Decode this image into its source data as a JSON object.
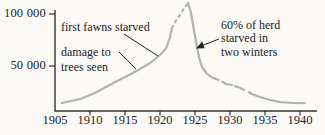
{
  "chart_data": {
    "type": "line",
    "title": "",
    "xlabel": "",
    "ylabel": "",
    "legend": "none",
    "grid": false,
    "x_axis": {
      "min": 1905,
      "max": 1941,
      "tick_labels": [
        "1905",
        "1910",
        "1915",
        "1920",
        "1925",
        "1930",
        "1935",
        "1940"
      ],
      "tick_years": [
        1905,
        1910,
        1915,
        1920,
        1925,
        1930,
        1935,
        1940
      ],
      "tick_mark_years": [
        1910,
        1915,
        1920,
        1925,
        1930,
        1935,
        1940
      ]
    },
    "y_axis": {
      "tick_labels": [
        "50 000",
        "100 000"
      ],
      "tick_values": [
        50000,
        100000
      ],
      "range_shown": [
        7000,
        112000
      ]
    },
    "series": [
      {
        "name": "deer herd population",
        "segments": [
          {
            "style": "solid",
            "points": [
              [
                1906.0,
                14400
              ],
              [
                1908.6,
                18300
              ],
              [
                1910.7,
                24000
              ],
              [
                1913.6,
                34600
              ],
              [
                1916.4,
                44200
              ],
              [
                1918.6,
                52900
              ],
              [
                1920.0,
                60600
              ],
              [
                1920.9,
                67300
              ],
              [
                1921.4,
                76900
              ],
              [
                1921.7,
                86500
              ]
            ]
          },
          {
            "style": "dashed",
            "points": [
              [
                1921.7,
                86500
              ],
              [
                1922.0,
                90400
              ],
              [
                1922.4,
                95000
              ],
              [
                1922.9,
                99500
              ],
              [
                1923.3,
                103800
              ],
              [
                1923.7,
                107700
              ],
              [
                1924.0,
                110600
              ]
            ]
          },
          {
            "style": "solid",
            "points": [
              [
                1924.0,
                110600
              ],
              [
                1924.4,
                101900
              ],
              [
                1924.7,
                90400
              ],
              [
                1925.0,
                78800
              ],
              [
                1925.3,
                67300
              ],
              [
                1925.6,
                57700
              ],
              [
                1926.0,
                49000
              ],
              [
                1926.6,
                43300
              ],
              [
                1927.3,
                39400
              ],
              [
                1928.0,
                37500
              ],
              [
                1928.4,
                36500
              ]
            ]
          },
          {
            "style": "solid",
            "points": [
              [
                1928.9,
                35000
              ],
              [
                1929.4,
                32700
              ],
              [
                1930.3,
                31700
              ]
            ]
          },
          {
            "style": "solid",
            "points": [
              [
                1930.7,
                30700
              ],
              [
                1931.4,
                29000
              ],
              [
                1932.0,
                26900
              ]
            ]
          },
          {
            "style": "solid",
            "points": [
              [
                1932.7,
                25000
              ],
              [
                1933.1,
                23100
              ],
              [
                1934.3,
                20200
              ],
              [
                1935.7,
                17300
              ],
              [
                1937.1,
                15400
              ],
              [
                1938.9,
                14400
              ],
              [
                1940.7,
                14300
              ]
            ]
          }
        ]
      }
    ],
    "sampled_values": {
      "1906": 14000,
      "1910": 22000,
      "1915": 39000,
      "1920": 61000,
      "1924_peak": 110000,
      "1926": 49000,
      "1930": 31000,
      "1935": 18000,
      "1940": 14000
    },
    "annotations": [
      {
        "lines": [
          "first fawns starved"
        ],
        "points_to": "rising curve ~1921"
      },
      {
        "lines": [
          "damage to",
          "trees seen"
        ],
        "points_to": "rising curve ~1917"
      },
      {
        "lines": [
          "60% of herd",
          "starved in",
          "two winters"
        ],
        "points_to": "crash after 1924 peak (arrow)"
      }
    ],
    "colors": {
      "background": "#fbfaf7",
      "curve": "#b2b2b2",
      "axis": "#333333",
      "text": "#222222"
    }
  }
}
